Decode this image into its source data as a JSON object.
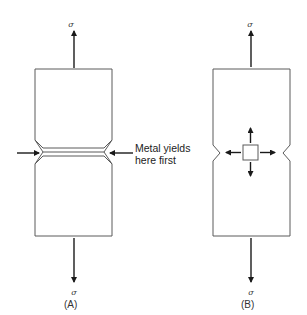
{
  "figure_a": {
    "label": "(A)",
    "sigma_top": "σ",
    "sigma_bottom": "σ",
    "annotation_line1": "Metal yields",
    "annotation_line2": "here first"
  },
  "figure_b": {
    "label": "(B)",
    "sigma_top": "σ",
    "sigma_bottom": "σ"
  },
  "colors": {
    "outline": "#5a5a5a",
    "arrows": "#1a1a1a",
    "background": "#ffffff"
  }
}
